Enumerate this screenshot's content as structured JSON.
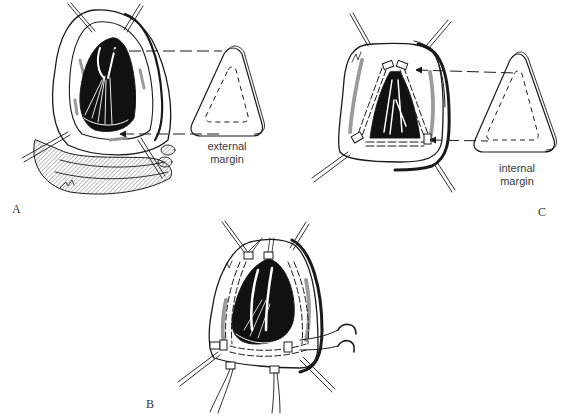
{
  "figure": {
    "panels": [
      {
        "id": "A",
        "label": "A",
        "description": "Heart with opened ventricle; triangular patch sized by external margin",
        "patch_caption": [
          "external",
          "margin"
        ]
      },
      {
        "id": "B",
        "label": "B",
        "description": "Patch sutured into ventriculotomy with pledgeted sutures and clamp"
      },
      {
        "id": "C",
        "label": "C",
        "description": "Heart with pledgeted suture line; triangular patch sized by internal margin",
        "patch_caption": [
          "internal",
          "margin"
        ]
      }
    ],
    "colors": {
      "ink": "#1a1a1a",
      "shade": "#9a9a9a",
      "cavity": "#111111",
      "background": "#ffffff"
    }
  }
}
